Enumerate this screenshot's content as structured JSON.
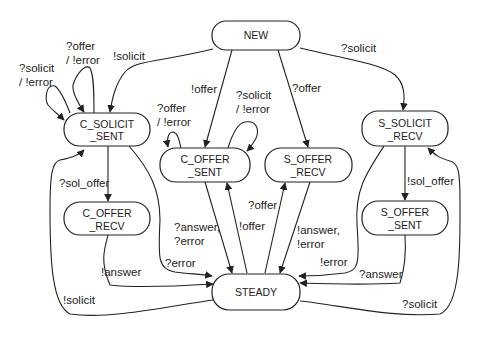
{
  "diagram": {
    "colors": {
      "stroke": "#222222",
      "background": "#ffffff",
      "text": "#222222"
    },
    "nodes": {
      "new": {
        "line1": "NEW",
        "line2": ""
      },
      "c_solicit_sent": {
        "line1": "C_SOLICIT",
        "line2": "_SENT"
      },
      "c_offer_sent": {
        "line1": "C_OFFER",
        "line2": "_SENT"
      },
      "s_offer_recv": {
        "line1": "S_OFFER",
        "line2": "_RECV"
      },
      "s_solicit_recv": {
        "line1": "S_SOLICIT",
        "line2": "_RECV"
      },
      "c_offer_recv": {
        "line1": "C_OFFER",
        "line2": "_RECV"
      },
      "s_offer_sent": {
        "line1": "S_OFFER",
        "line2": "_SENT"
      },
      "steady": {
        "line1": "STEADY",
        "line2": ""
      }
    },
    "edges": {
      "new_to_c_solicit_sent": {
        "label1": "!solicit",
        "label2": ""
      },
      "new_to_c_offer_sent": {
        "label1": "!offer",
        "label2": ""
      },
      "new_to_s_offer_recv": {
        "label1": "?offer",
        "label2": ""
      },
      "new_to_s_solicit_recv": {
        "label1": "?solicit",
        "label2": ""
      },
      "c_solicit_sent_self_solicit": {
        "label1": "?solicit",
        "label2": "/ !error"
      },
      "c_solicit_sent_self_offer": {
        "label1": "?offer",
        "label2": "/ !error"
      },
      "c_offer_sent_self_offer": {
        "label1": "?offer",
        "label2": "/ !error"
      },
      "c_offer_sent_self_solicit": {
        "label1": "?solicit",
        "label2": "/ !error"
      },
      "c_solicit_sent_to_c_offer_recv": {
        "label1": "?sol_offer",
        "label2": ""
      },
      "c_solicit_sent_to_steady": {
        "label1": "?error",
        "label2": ""
      },
      "c_offer_recv_to_steady": {
        "label1": "!answer",
        "label2": ""
      },
      "steady_to_c_solicit_sent": {
        "label1": "!solicit",
        "label2": ""
      },
      "c_offer_sent_to_steady": {
        "label1": "?answer,",
        "label2": "?error"
      },
      "steady_to_c_offer_sent": {
        "label1": "!offer",
        "label2": ""
      },
      "steady_to_s_offer_recv": {
        "label1": "?offer",
        "label2": ""
      },
      "s_offer_recv_to_steady": {
        "label1": "!answer,",
        "label2": "!error"
      },
      "s_solicit_recv_to_steady": {
        "label1": "!error",
        "label2": ""
      },
      "s_solicit_recv_to_s_offer_sent": {
        "label1": "!sol_offer",
        "label2": ""
      },
      "s_offer_sent_to_steady": {
        "label1": "?answer",
        "label2": ""
      },
      "steady_to_s_solicit_recv": {
        "label1": "?solicit",
        "label2": ""
      }
    }
  }
}
